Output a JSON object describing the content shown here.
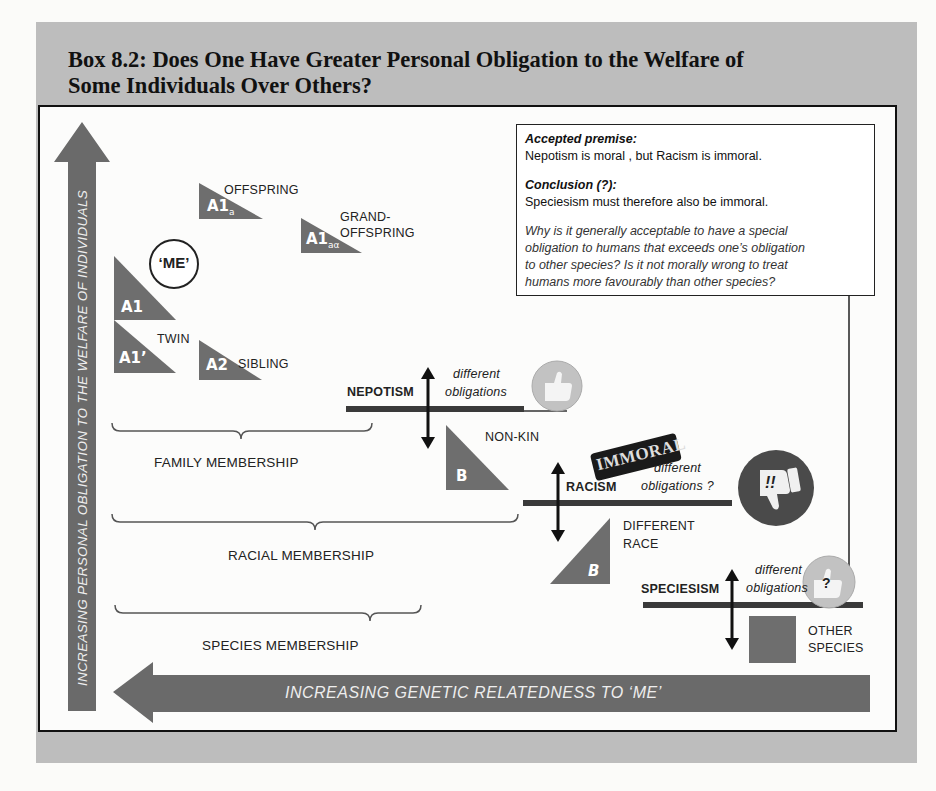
{
  "title": {
    "line1": "Box 8.2: Does One Have Greater Personal Obligation to the Welfare of",
    "line2": "Some Individuals Over Others?"
  },
  "textbox": {
    "premise_heading": "Accepted premise:",
    "premise_text": "Nepotism is moral , but  Racism is  immoral.",
    "conclusion_heading": "Conclusion (?):",
    "conclusion_text": "Speciesism must therefore also be immoral.",
    "question_line1": "Why is it generally acceptable to have a special",
    "question_line2": "obligation to humans that exceeds one’s obligation",
    "question_line3": "to other species?  Is it not morally wrong to treat",
    "question_line4": "humans more favourably than other species?"
  },
  "axes": {
    "vertical": "INCREASING  PERSONAL  OBLIGATION  TO  THE  WELFARE  OF  INDIVIDUALS",
    "horizontal": "INCREASING  GENETIC  RELATEDNESS  TO  ‘ME’"
  },
  "me_label": "‘ME’",
  "individuals": [
    {
      "id": "A1",
      "label": "A1",
      "sub": "",
      "name": ""
    },
    {
      "id": "A1prime",
      "label": "A1’",
      "sub": "",
      "name": "TWIN"
    },
    {
      "id": "A1a",
      "label": "A1",
      "sub": "a",
      "name": "OFFSPRING"
    },
    {
      "id": "A1aa",
      "label": "A1",
      "sub": "aα",
      "name_line1": "GRAND-",
      "name_line2": "OFFSPRING"
    },
    {
      "id": "A2",
      "label": "A2",
      "sub": "",
      "name": "SIBLING"
    },
    {
      "id": "B_nonkin",
      "label": "B",
      "sub": "",
      "name": "NON-KIN"
    },
    {
      "id": "B_race",
      "label": "B",
      "sub": "",
      "name_line1": "DIFFERENT",
      "name_line2": "RACE"
    },
    {
      "id": "other_species",
      "label": "",
      "sub": "",
      "name_line1": "OTHER",
      "name_line2": "SPECIES"
    }
  ],
  "memberships": {
    "family": "FAMILY  MEMBERSHIP",
    "racial": "RACIAL  MEMBERSHIP",
    "species": "SPECIES  MEMBERSHIP"
  },
  "balances": {
    "nepotism": {
      "label": "NEPOTISM",
      "text1": "different",
      "text2": "obligations",
      "icon": "thumbs-up"
    },
    "racism": {
      "label": "RACISM",
      "text1": "different",
      "text2": "obligations ?",
      "icon": "thumbs-down",
      "icon_text": "!!",
      "stamp": "IMMORAL"
    },
    "speciesism": {
      "label": "SPECIESISM",
      "text1": "different",
      "text2": "obligations",
      "icon": "thumbs-up",
      "icon_text": "?"
    }
  },
  "colors": {
    "shape_gray": "#6e6e6e",
    "arrow_gray": "#6a6a6a",
    "frame_band": "#bdbdbd",
    "thumb_up_bg": "#bdbdbd",
    "thumb_down_bg": "#4a4a4a"
  }
}
